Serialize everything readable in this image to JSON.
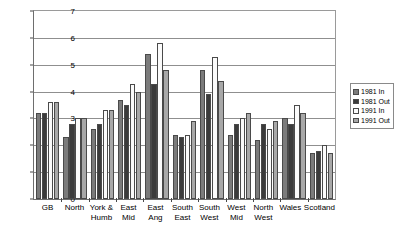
{
  "chart_data": {
    "type": "bar",
    "title": "",
    "xlabel": "",
    "ylabel": "Per cent",
    "ylim": [
      0,
      7
    ],
    "yticks": [
      0,
      1,
      2,
      3,
      4,
      5,
      6,
      7
    ],
    "grid": true,
    "legend_position": "right",
    "categories": [
      "GB",
      "North",
      "York &\nHumb",
      "East\nMid",
      "East\nAng",
      "South\nEast",
      "South\nWest",
      "West\nMid",
      "North\nWest",
      "Wales",
      "Scotland"
    ],
    "series": [
      {
        "name": "1981 In",
        "color": "#7b7b7b",
        "values": [
          3.2,
          2.3,
          2.6,
          3.7,
          5.4,
          2.4,
          4.8,
          2.4,
          2.2,
          3.0,
          1.7
        ]
      },
      {
        "name": "1981 Out",
        "color": "#3b3b3b",
        "values": [
          3.2,
          2.8,
          2.8,
          3.5,
          4.3,
          2.3,
          3.9,
          2.8,
          2.8,
          2.8,
          1.8
        ]
      },
      {
        "name": "1991 In",
        "color": "#fbfbfb",
        "values": [
          3.6,
          3.0,
          3.3,
          4.3,
          5.8,
          2.4,
          5.3,
          3.0,
          2.6,
          3.5,
          2.0
        ]
      },
      {
        "name": "1991 Out",
        "color": "#a8a8a8",
        "values": [
          3.6,
          3.0,
          3.3,
          4.0,
          4.8,
          2.9,
          4.4,
          3.2,
          2.9,
          3.2,
          1.7
        ]
      }
    ]
  }
}
